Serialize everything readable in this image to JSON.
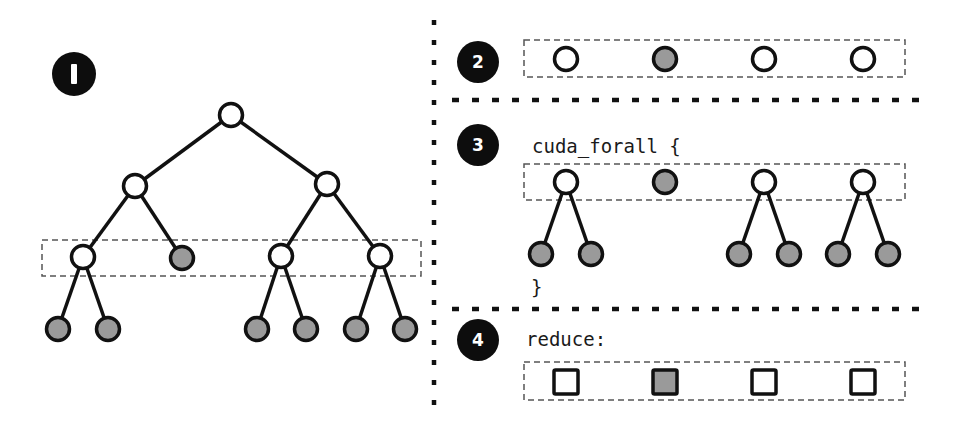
{
  "colors": {
    "ink": "#111111",
    "node_fill_white": "#ffffff",
    "node_fill_gray": "#9a9a9a",
    "dash": "#555555",
    "badge": "#0d0d0d"
  },
  "panel1": {
    "badge_label": "I",
    "tree": {
      "nodes": [
        {
          "id": "root",
          "x": 231,
          "y": 115,
          "fill": "white"
        },
        {
          "id": "l2a",
          "x": 135,
          "y": 186,
          "fill": "white"
        },
        {
          "id": "l2b",
          "x": 327,
          "y": 184,
          "fill": "white"
        },
        {
          "id": "l3a",
          "x": 83,
          "y": 257,
          "fill": "white"
        },
        {
          "id": "l3b",
          "x": 182,
          "y": 258,
          "fill": "gray"
        },
        {
          "id": "l3c",
          "x": 281,
          "y": 256,
          "fill": "white"
        },
        {
          "id": "l3d",
          "x": 380,
          "y": 256,
          "fill": "white"
        },
        {
          "id": "leaf1",
          "x": 58,
          "y": 329,
          "fill": "gray"
        },
        {
          "id": "leaf2",
          "x": 108,
          "y": 329,
          "fill": "gray"
        },
        {
          "id": "leaf3",
          "x": 257,
          "y": 329,
          "fill": "gray"
        },
        {
          "id": "leaf4",
          "x": 306,
          "y": 329,
          "fill": "gray"
        },
        {
          "id": "leaf5",
          "x": 356,
          "y": 329,
          "fill": "gray"
        },
        {
          "id": "leaf6",
          "x": 405,
          "y": 329,
          "fill": "gray"
        }
      ],
      "edges": [
        [
          "root",
          "l2a"
        ],
        [
          "root",
          "l2b"
        ],
        [
          "l2a",
          "l3a"
        ],
        [
          "l2a",
          "l3b"
        ],
        [
          "l2b",
          "l3c"
        ],
        [
          "l2b",
          "l3d"
        ],
        [
          "l3a",
          "leaf1"
        ],
        [
          "l3a",
          "leaf2"
        ],
        [
          "l3c",
          "leaf3"
        ],
        [
          "l3c",
          "leaf4"
        ],
        [
          "l3d",
          "leaf5"
        ],
        [
          "l3d",
          "leaf6"
        ]
      ],
      "highlight_box": {
        "x": 42,
        "y": 240,
        "w": 379,
        "h": 36
      }
    }
  },
  "panel2": {
    "badge_label": "2",
    "items": [
      "white",
      "gray",
      "white",
      "white"
    ]
  },
  "panel3": {
    "badge_label": "3",
    "code_open": "cuda_forall {",
    "code_close": "}",
    "items": [
      {
        "fill": "white",
        "children": [
          "gray",
          "gray"
        ]
      },
      {
        "fill": "gray",
        "children": []
      },
      {
        "fill": "white",
        "children": [
          "gray",
          "gray"
        ]
      },
      {
        "fill": "white",
        "children": [
          "gray",
          "gray"
        ]
      }
    ]
  },
  "panel4": {
    "badge_label": "4",
    "code_label": "reduce:",
    "items": [
      "white",
      "gray",
      "white",
      "white"
    ]
  }
}
